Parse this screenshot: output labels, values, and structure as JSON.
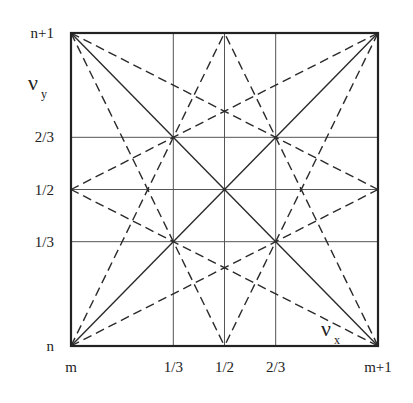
{
  "diagram": {
    "x_axis": {
      "symbol": "ν",
      "subscript": "x",
      "ticks": [
        {
          "value": 0,
          "label": "m"
        },
        {
          "value": 0.3333,
          "label": "1/3"
        },
        {
          "value": 0.5,
          "label": "1/2"
        },
        {
          "value": 0.6667,
          "label": "2/3"
        },
        {
          "value": 1,
          "label": "m+1"
        }
      ]
    },
    "y_axis": {
      "symbol": "ν",
      "subscript": "y",
      "ticks": [
        {
          "value": 0,
          "label": "n"
        },
        {
          "value": 0.3333,
          "label": "1/3"
        },
        {
          "value": 0.5,
          "label": "1/2"
        },
        {
          "value": 0.6667,
          "label": "2/3"
        },
        {
          "value": 1,
          "label": "n+1"
        }
      ]
    },
    "gridlines": {
      "vertical": [
        0.3333,
        0.5,
        0.6667
      ],
      "horizontal": [
        0.3333,
        0.5,
        0.6667
      ]
    },
    "solid_lines": [
      {
        "from": [
          0,
          1
        ],
        "to": [
          1,
          0
        ]
      },
      {
        "from": [
          0,
          0
        ],
        "to": [
          1,
          1
        ]
      }
    ],
    "dashed_lines": [
      {
        "from": [
          0,
          1
        ],
        "to": [
          0.5,
          0
        ]
      },
      {
        "from": [
          0,
          1
        ],
        "to": [
          1,
          0.5
        ]
      },
      {
        "from": [
          0,
          0
        ],
        "to": [
          0.5,
          1
        ]
      },
      {
        "from": [
          0,
          0
        ],
        "to": [
          1,
          0.5
        ]
      },
      {
        "from": [
          1,
          1
        ],
        "to": [
          0.5,
          0
        ]
      },
      {
        "from": [
          1,
          1
        ],
        "to": [
          0,
          0.5
        ]
      },
      {
        "from": [
          1,
          0
        ],
        "to": [
          0.5,
          1
        ]
      },
      {
        "from": [
          1,
          0
        ],
        "to": [
          0,
          0.5
        ]
      }
    ],
    "line_color": "#2a2a2a"
  }
}
